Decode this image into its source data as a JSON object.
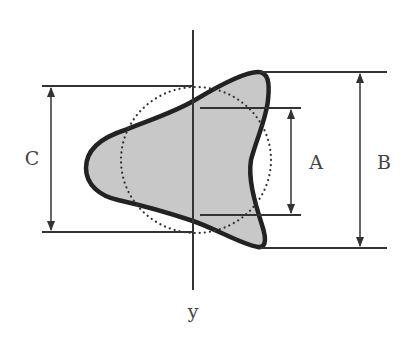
{
  "diagram": {
    "title": "",
    "labels": {
      "A": "A",
      "B": "B",
      "C": "C",
      "axis": "y"
    },
    "elements": {
      "shape": "filled rounded triangular profile (cross-section)",
      "reference_circle": "dotted circle",
      "axis": "vertical y axis"
    },
    "dimensions": [
      {
        "name": "A",
        "description": "inner height between horizontal reference lines on right side"
      },
      {
        "name": "B",
        "description": "full height of shape from top tip to bottom tip"
      },
      {
        "name": "C",
        "description": "height of dotted circle (left side)"
      }
    ],
    "colors": {
      "shape_fill": "#c8c8c8",
      "shape_stroke": "#222222",
      "line": "#333333",
      "label": "#444444",
      "background": "#ffffff"
    }
  }
}
